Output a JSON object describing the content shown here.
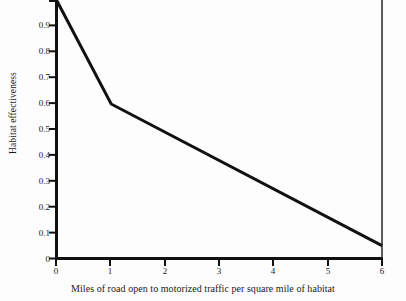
{
  "chart_data": {
    "type": "line",
    "title": "",
    "xlabel": "Miles of road open to motorized traffic per square mile of habitat",
    "ylabel": "Habitat effectiveness",
    "x": [
      0,
      1,
      6
    ],
    "values": [
      1.0,
      0.6,
      0.05
    ],
    "series": [
      {
        "name": "Habitat effectiveness",
        "x": [
          0,
          1,
          6
        ],
        "values": [
          1.0,
          0.6,
          0.05
        ]
      }
    ],
    "xlim": [
      0,
      6
    ],
    "ylim": [
      0,
      1.0
    ],
    "xticks": [
      0,
      1,
      2,
      3,
      4,
      5,
      6
    ],
    "xtick_labels": [
      "0",
      "1",
      "2",
      "3",
      "4",
      "5",
      "6"
    ],
    "yticks": [
      0,
      0.1,
      0.2,
      0.3,
      0.4,
      0.5,
      0.6,
      0.7,
      0.8,
      0.9,
      1.0
    ],
    "ytick_labels": [
      "0",
      "0.1",
      "0.2",
      "0.3",
      "0.4",
      "0.5",
      "0.6",
      "0.7",
      "0.8",
      "0.9",
      "1"
    ],
    "grid": false,
    "legend": false,
    "legend_position": "none",
    "line_color": "#111111",
    "background_color": "#fdfdfd",
    "axis_color": "#111111"
  }
}
